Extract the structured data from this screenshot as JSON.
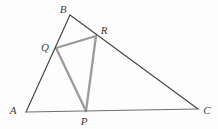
{
  "figure": {
    "background": "#fdfdfd",
    "outer_stroke": "#474747",
    "base_stroke": "#6f6f6f",
    "inner_stroke": "#9b9b9b",
    "label_color": "#3d3d3d",
    "vertices": {
      "A": {
        "label": "A",
        "x": 26,
        "y": 112,
        "label_x": 13,
        "label_y": 114
      },
      "B": {
        "label": "B",
        "x": 70,
        "y": 15,
        "label_x": 63,
        "label_y": 13
      },
      "C": {
        "label": "C",
        "x": 198,
        "y": 109,
        "label_x": 207,
        "label_y": 114
      },
      "P": {
        "label": "P",
        "x": 86,
        "y": 111,
        "label_x": 84,
        "label_y": 125
      },
      "Q": {
        "label": "Q",
        "x": 56,
        "y": 48,
        "label_x": 45,
        "label_y": 51
      },
      "R": {
        "label": "R",
        "x": 96,
        "y": 36,
        "label_x": 104,
        "label_y": 34
      }
    },
    "outer_edges": [
      "AB",
      "BC",
      "AC"
    ],
    "inner_edges": [
      "QR",
      "RP",
      "PQ"
    ]
  }
}
